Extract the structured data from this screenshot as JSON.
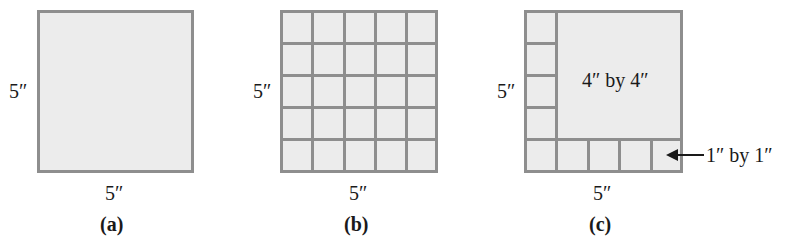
{
  "figures": [
    {
      "id": "a",
      "caption": "(a)",
      "side_label": "5″",
      "bottom_label": "5″",
      "description": "5 inch by 5 inch square"
    },
    {
      "id": "b",
      "caption": "(b)",
      "side_label": "5″",
      "bottom_label": "5″",
      "grid": {
        "rows": 5,
        "cols": 5
      },
      "description": "5 by 5 square divided into 25 one-inch squares"
    },
    {
      "id": "c",
      "caption": "(c)",
      "side_label": "5″",
      "bottom_label": "5″",
      "inner_label": "4″ by 4″",
      "callout_label": "1″ by 1″",
      "description": "5 by 5 square split into a 4 by 4 square plus 9 one-inch squares"
    }
  ],
  "colors": {
    "fill": "#ececec",
    "stroke": "#8e8e8e",
    "text": "#1a1a1a"
  }
}
